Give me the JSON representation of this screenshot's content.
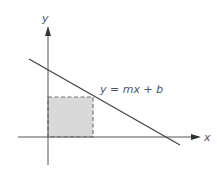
{
  "diagram": {
    "axes": {
      "x_label": "x",
      "y_label": "y"
    },
    "line": {
      "equation_label": "y = mx + b",
      "slope_sign": "negative"
    },
    "rectangle": {
      "style": "dashed",
      "fill_color": "#d9d9d9",
      "description": "Shaded rectangle under the line with one corner at the origin and the opposite corner on the line"
    },
    "colors": {
      "axis": "#555555",
      "line": "#444444",
      "text": "#555555"
    }
  }
}
